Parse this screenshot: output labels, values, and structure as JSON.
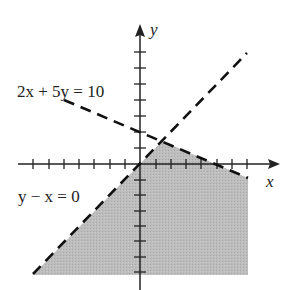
{
  "figure": {
    "type": "inequality-region-graph",
    "axes": {
      "x_label": "x",
      "y_label": "y",
      "x_ticks": [
        -7,
        -6,
        -5,
        -4,
        -3,
        -2,
        -1,
        1,
        2,
        3,
        4,
        5,
        6,
        7
      ],
      "y_ticks": [
        -7,
        -6,
        -5,
        -4,
        -3,
        -2,
        -1,
        1,
        2,
        3,
        4,
        5,
        6,
        7
      ]
    },
    "lines": [
      {
        "label": "2x + 5y = 10",
        "style": "dashed",
        "color": "#111111"
      },
      {
        "label": "y − x = 0",
        "style": "dashed",
        "color": "#111111"
      }
    ],
    "region": {
      "fill": "#b8b8b8",
      "description": "shaded region below both dashed lines"
    }
  }
}
